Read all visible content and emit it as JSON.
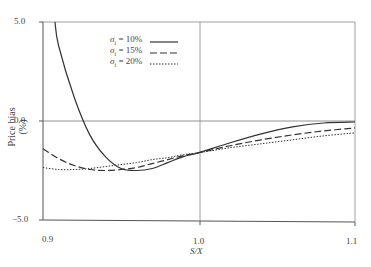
{
  "chart_data": {
    "type": "line",
    "title": "",
    "xlabel": "S/X",
    "ylabel": "Price bias (%)",
    "xlim": [
      0.9,
      1.1
    ],
    "ylim": [
      -5.0,
      5.0
    ],
    "xticks": [
      "0.9",
      "1.0",
      "1.1"
    ],
    "yticks": [
      "5.0",
      "0.0",
      "-5.0"
    ],
    "grid": false,
    "reference_lines": {
      "y": 0.0,
      "x": 1.0
    },
    "legend_position": "upper-center",
    "x": [
      0.9,
      0.91,
      0.92,
      0.93,
      0.94,
      0.95,
      0.96,
      0.97,
      0.98,
      0.99,
      1.0,
      1.02,
      1.04,
      1.06,
      1.08,
      1.1
    ],
    "series": [
      {
        "name": "σi = 10%",
        "style": "solid",
        "values": [
          null,
          3.8,
          1.2,
          -0.7,
          -1.8,
          -2.4,
          -2.5,
          -2.4,
          -2.1,
          -1.8,
          -1.6,
          -1.1,
          -0.65,
          -0.3,
          -0.1,
          -0.05
        ]
      },
      {
        "name": "σi = 15%",
        "style": "dashed",
        "values": [
          -1.4,
          -1.9,
          -2.25,
          -2.45,
          -2.5,
          -2.45,
          -2.35,
          -2.15,
          -1.95,
          -1.75,
          -1.6,
          -1.25,
          -0.95,
          -0.7,
          -0.5,
          -0.35
        ]
      },
      {
        "name": "σi = 20%",
        "style": "dotted",
        "values": [
          -2.35,
          -2.45,
          -2.45,
          -2.4,
          -2.3,
          -2.2,
          -2.1,
          -1.95,
          -1.85,
          -1.7,
          -1.6,
          -1.35,
          -1.15,
          -0.95,
          -0.75,
          -0.6
        ]
      }
    ]
  },
  "axis": {
    "ylabel": "Price bias (%)",
    "xlabel": "S/X",
    "yticks": [
      "5.0",
      "0.0",
      "−5.0"
    ],
    "xticks": [
      "0.9",
      "1.0",
      "1.1"
    ]
  },
  "legend": {
    "items": [
      {
        "sym": "σ",
        "sub": "i",
        "text": " = 10%"
      },
      {
        "sym": "σ",
        "sub": "i",
        "text": " = 15%"
      },
      {
        "sym": "σ",
        "sub": "i",
        "text": " = 20%"
      }
    ]
  }
}
